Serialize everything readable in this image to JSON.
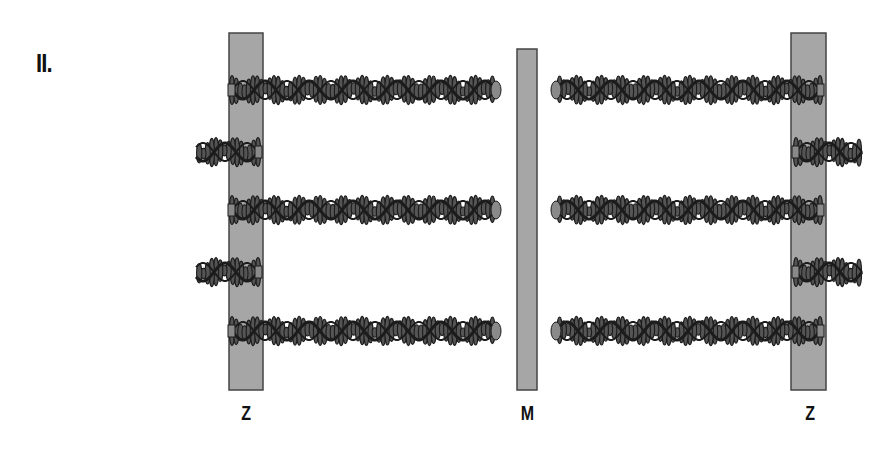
{
  "figure": {
    "panel_label": "II.",
    "lines": [
      {
        "id": "z-left",
        "label": "Z",
        "type": "Z-disc"
      },
      {
        "id": "m-center",
        "label": "M",
        "type": "M-line"
      },
      {
        "id": "z-right",
        "label": "Z",
        "type": "Z-disc"
      }
    ],
    "thin_filaments": {
      "left_long_rows": 3,
      "left_short_stubs": 2,
      "right_long_rows": 3,
      "right_short_stubs": 2
    },
    "colors": {
      "disc_fill": "#a6a6a6",
      "disc_stroke": "#444444",
      "filament_dark": "#1c1c1c",
      "bead_fill": "#555555",
      "cap_fill": "#8a8a8a",
      "text": "#111111"
    }
  }
}
